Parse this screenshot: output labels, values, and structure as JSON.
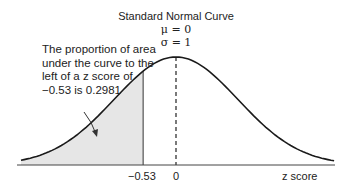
{
  "title": "Standard Normal Curve",
  "mu_label": "μ = 0",
  "sigma_label": "σ = 1",
  "annotation": "The proportion of area under the curve to the left of a z score of −0.53 is 0.2981",
  "tick_neg": "−0.53",
  "tick_zero": "0",
  "xlabel": "z score",
  "colors": {
    "shade": "#e6e6e6",
    "line": "#222222"
  },
  "chart_data": {
    "type": "area",
    "title": "Standard Normal Curve",
    "mean": 0,
    "sd": 1,
    "shaded_region": {
      "from": "-inf",
      "to": -0.53,
      "area": 0.2981
    },
    "xlabel": "z score",
    "ticks": [
      -0.53,
      0
    ]
  }
}
